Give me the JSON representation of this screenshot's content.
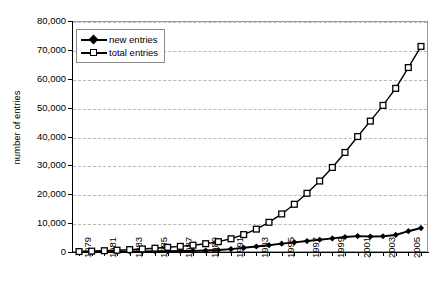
{
  "chart_data": {
    "type": "line",
    "title": "",
    "subtitle": "",
    "xlabel": "",
    "ylabel": "number of entries",
    "xlim": [
      1978.5,
      2006.5
    ],
    "ylim": [
      0,
      80000
    ],
    "ytick_step": 10000,
    "xtick_step": 1,
    "xlabel_step": 2,
    "grid": true,
    "grid_style": "dashed-horizontal",
    "legend_position": "top-left-inside",
    "yticks": [
      0,
      10000,
      20000,
      30000,
      40000,
      50000,
      60000,
      70000,
      80000
    ],
    "ytick_labels": [
      "0",
      "10,000",
      "20,000",
      "30,000",
      "40,000",
      "50,000",
      "60,000",
      "70,000",
      "80,000"
    ],
    "x": [
      1979,
      1980,
      1981,
      1982,
      1983,
      1984,
      1985,
      1986,
      1987,
      1988,
      1989,
      1990,
      1991,
      1992,
      1993,
      1994,
      1995,
      1996,
      1997,
      1998,
      1999,
      2000,
      2001,
      2002,
      2003,
      2004,
      2005,
      2006
    ],
    "xtick_labels": [
      "1979",
      "",
      "1981",
      "",
      "1983",
      "",
      "1985",
      "",
      "1987",
      "",
      "1989",
      "",
      "1991",
      "",
      "1993",
      "",
      "1995",
      "",
      "1997",
      "",
      "1999",
      "",
      "2001",
      "",
      "2003",
      "",
      "2005",
      ""
    ],
    "xtick_labels_all": [
      "1979",
      "1980",
      "1981",
      "1982",
      "1983",
      "1984",
      "1985",
      "1986",
      "1987",
      "1988",
      "1989",
      "1990",
      "1991",
      "1992",
      "1993",
      "1994",
      "1995",
      "1996",
      "1997",
      "1998",
      "1999",
      "2000",
      "2001",
      "2002",
      "2003",
      "2004",
      "2005",
      "2006"
    ],
    "series": [
      {
        "name": "new entries",
        "marker": "filled-diamond",
        "color": "#000000",
        "values": [
          120,
          140,
          160,
          180,
          200,
          230,
          260,
          300,
          340,
          400,
          520,
          700,
          1000,
          1450,
          1900,
          2350,
          2900,
          3350,
          3800,
          4250,
          4700,
          5200,
          5500,
          5350,
          5450,
          5900,
          7200,
          8300
        ]
      },
      {
        "name": "total entries",
        "marker": "open-square",
        "color": "#000000",
        "values": [
          150,
          300,
          450,
          630,
          830,
          1060,
          1320,
          1620,
          1960,
          2360,
          2880,
          3580,
          4580,
          6030,
          7930,
          10280,
          13180,
          16530,
          20330,
          24580,
          29280,
          34480,
          39980,
          45330,
          50780,
          56680,
          63880,
          71200
        ]
      }
    ]
  },
  "legend": {
    "items": [
      {
        "label": "new entries",
        "marker": "filled-diamond"
      },
      {
        "label": "total entries",
        "marker": "open-square"
      }
    ]
  }
}
